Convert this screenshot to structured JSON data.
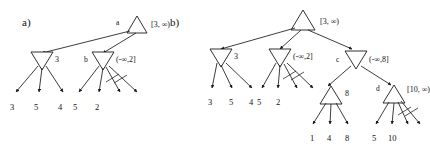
{
  "figure": {
    "panels": [
      {
        "id": "a",
        "label": "a)"
      },
      {
        "id": "b",
        "label": "b)"
      }
    ],
    "symbols": {
      "infinity": "∞"
    }
  },
  "panel_a": {
    "label": "a)",
    "nodes": [
      {
        "name": "root-a",
        "node_label": "a",
        "interval": "[3, ∞)",
        "shape": "triangle-up"
      },
      {
        "name": "node-3",
        "node_label": "",
        "interval": "3",
        "shape": "triangle-down"
      },
      {
        "name": "node-b",
        "node_label": "b",
        "interval": "(-∞,2]",
        "shape": "triangle-down"
      }
    ],
    "leaves_left": [
      "3",
      "5",
      "4"
    ],
    "leaves_right": [
      "5",
      "2"
    ],
    "struck_edges": 2
  },
  "panel_b": {
    "label": "b)",
    "nodes": [
      {
        "name": "root-b",
        "node_label": "",
        "interval": "[3, ∞)",
        "shape": "triangle-up"
      },
      {
        "name": "node-3",
        "node_label": "",
        "interval": "3",
        "shape": "triangle-down"
      },
      {
        "name": "node-neg-inf-2",
        "node_label": "",
        "interval": "(-∞,2]",
        "shape": "triangle-down"
      },
      {
        "name": "node-c",
        "node_label": "c",
        "interval": "(-∞,8]",
        "shape": "triangle-down"
      },
      {
        "name": "node-8",
        "node_label": "",
        "interval": "8",
        "shape": "triangle-up"
      },
      {
        "name": "node-d",
        "node_label": "d",
        "interval": "[10, ∞)",
        "shape": "triangle-up"
      }
    ],
    "leaves_group1": [
      "3",
      "5",
      "4"
    ],
    "leaves_group2": [
      "5",
      "2"
    ],
    "leaves_group3": [
      "1",
      "4",
      "8"
    ],
    "leaves_group4": [
      "5",
      "10"
    ],
    "struck_edges_node2": 2,
    "struck_edges_node_d": 2
  },
  "colors": {
    "ink": "#1a1a1a",
    "background": "#ffffff"
  }
}
